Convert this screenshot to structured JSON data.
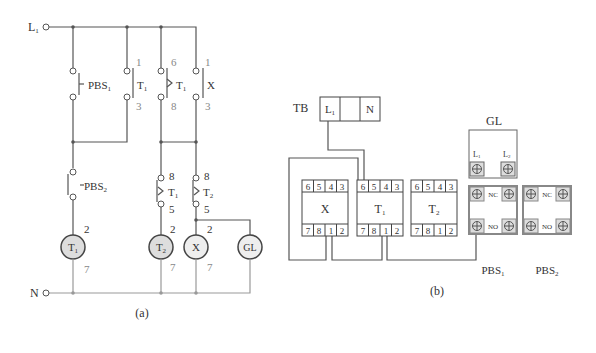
{
  "diagram_a": {
    "caption": "(a)",
    "supply_line": "L",
    "supply_line_sub": "1",
    "neutral": "N",
    "contacts": [
      {
        "label": "PBS",
        "sub": "1",
        "type": "push-button-no"
      },
      {
        "label": "T",
        "sub": "1",
        "type": "no-contact",
        "pin_top": "1",
        "pin_bottom": "3"
      },
      {
        "label": "T",
        "sub": "1",
        "type": "timer-no",
        "pin_top": "6",
        "pin_bottom": "8"
      },
      {
        "label": "X",
        "sub": "",
        "type": "no-contact",
        "pin_top": "1",
        "pin_bottom": "3"
      },
      {
        "label": "PBS",
        "sub": "2",
        "type": "push-button-nc"
      },
      {
        "label": "T",
        "sub": "1",
        "type": "timer-nc",
        "pin_top": "8",
        "pin_bottom": "5"
      },
      {
        "label": "T",
        "sub": "2",
        "type": "timer-nc",
        "pin_top": "8",
        "pin_bottom": "5"
      }
    ],
    "loads": [
      {
        "label": "T",
        "sub": "1",
        "pin_top": "2",
        "pin_bottom": "7"
      },
      {
        "label": "T",
        "sub": "2",
        "pin_top": "2",
        "pin_bottom": "7"
      },
      {
        "label": "X",
        "sub": "",
        "pin_top": "2",
        "pin_bottom": "7"
      },
      {
        "label": "GL",
        "sub": "",
        "pin_top": "",
        "pin_bottom": ""
      }
    ]
  },
  "diagram_b": {
    "caption": "(b)",
    "terminal_block": {
      "label": "TB",
      "cells": [
        "L1",
        "",
        "N"
      ]
    },
    "relays": [
      {
        "label": "X",
        "sub": "",
        "top_pins": [
          "6",
          "5",
          "4",
          "3"
        ],
        "bottom_pins": [
          "7",
          "8",
          "1",
          "2"
        ]
      },
      {
        "label": "T",
        "sub": "1",
        "top_pins": [
          "6",
          "5",
          "4",
          "3"
        ],
        "bottom_pins": [
          "7",
          "8",
          "1",
          "2"
        ]
      },
      {
        "label": "T",
        "sub": "2",
        "top_pins": [
          "6",
          "5",
          "4",
          "3"
        ],
        "bottom_pins": [
          "7",
          "8",
          "1",
          "2"
        ]
      }
    ],
    "lamp": {
      "label": "GL",
      "terminals": [
        "L1",
        "L2"
      ]
    },
    "push_buttons": [
      {
        "label": "PBS",
        "sub": "1",
        "contacts": [
          "NC",
          "NO"
        ]
      },
      {
        "label": "PBS",
        "sub": "2",
        "contacts": [
          "NC",
          "NO"
        ]
      }
    ]
  }
}
